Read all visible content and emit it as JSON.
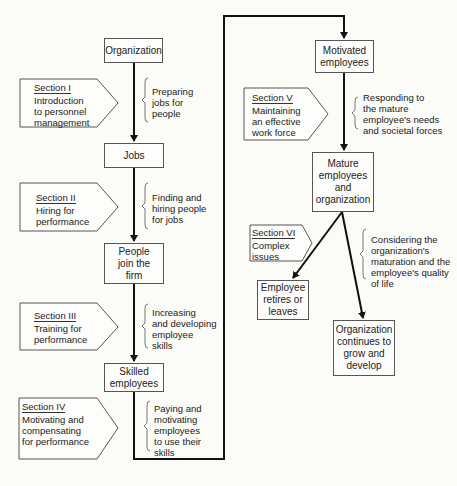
{
  "figure": {
    "type": "flowchart",
    "top_caption_cut": "",
    "nodes": [
      {
        "id": "organization",
        "label": "Organization"
      },
      {
        "id": "jobs",
        "label": "Jobs"
      },
      {
        "id": "people_join",
        "label": "People\njoin the\nfirm"
      },
      {
        "id": "skilled",
        "label": "Skilled\nemployees"
      },
      {
        "id": "motivated",
        "label": "Motivated\nemployees"
      },
      {
        "id": "mature",
        "label": "Mature\nemployees\nand\norganization"
      },
      {
        "id": "retires",
        "label": "Employee\nretires or\nleaves"
      },
      {
        "id": "continues",
        "label": "Organization\ncontinues to\ngrow and\ndevelop"
      }
    ],
    "sections": [
      {
        "title": "Section I",
        "body": "Introduction\nto personnel\nmanagement"
      },
      {
        "title": "Section II",
        "body": "Hiring for\nperformance"
      },
      {
        "title": "Section III",
        "body": "Training for\nperformance"
      },
      {
        "title": "Section IV",
        "body": "Motivating and\ncompensating\nfor performance"
      },
      {
        "title": "Section V",
        "body": "Maintaining\nan effective\nwork force"
      },
      {
        "title": "Section VI",
        "body": "Complex\nissues"
      }
    ],
    "notes": [
      "Preparing\njobs for\npeople",
      "Finding and\nhiring people\nfor jobs",
      "Increasing\nand developing\nemployee\nskills",
      "Paying and\nmotivating\nemployees\nto use their\nskills",
      "Responding to\nthe mature\nemployee's needs\nand societal forces",
      "Considering the\norganization's\nmaturation and the\nemployee's quality\nof life"
    ],
    "colors": {
      "line": "#111111",
      "box_border": "#555555",
      "background": "#fbfbf8"
    }
  }
}
